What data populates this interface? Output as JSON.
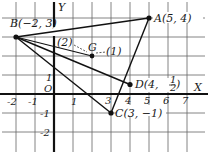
{
  "diagram": {
    "type": "coordinate-geometry",
    "axes": {
      "x_label": "X",
      "y_label": "Y",
      "origin_label": "O",
      "x_ticks": [
        "-2",
        "-1",
        "1",
        "3",
        "4",
        "5",
        "6",
        "7"
      ],
      "y_ticks": [
        "1",
        "-1",
        "-2"
      ]
    },
    "points": {
      "A": {
        "label": "A(5, 4)",
        "x": 5,
        "y": 4
      },
      "B": {
        "label": "B(−2, 3)",
        "x": -2,
        "y": 3
      },
      "C": {
        "label": "C(3, −1)",
        "x": 3,
        "y": -1
      },
      "D": {
        "label": "D(4, ",
        "frac_num": "1",
        "frac_den": "2",
        "x": 4,
        "y": 0.5
      },
      "G": {
        "label": "G",
        "x": 2,
        "y": 2
      }
    },
    "segment_ratio_labels": {
      "BG": "(2)",
      "GD": "(1)"
    },
    "colors": {
      "line": "#1a1a1a",
      "grid": "#555555",
      "background": "#ffffff"
    }
  }
}
